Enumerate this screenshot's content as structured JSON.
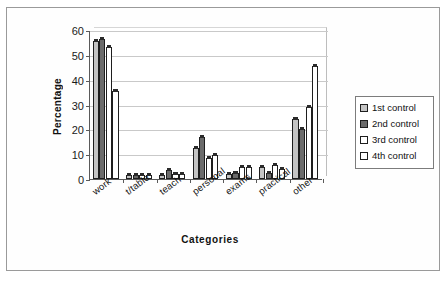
{
  "chart_data": {
    "type": "bar",
    "title": "",
    "xlabel": "Categories",
    "ylabel": "Percentage",
    "ylim": [
      0,
      60
    ],
    "yticks": [
      0,
      10,
      20,
      30,
      40,
      50,
      60
    ],
    "grid": true,
    "legend_position": "right",
    "categories": [
      "work",
      "t/table",
      "teach",
      "personal",
      "exams",
      "practical",
      "other"
    ],
    "series": [
      {
        "name": "1st control",
        "color": "#c4c4c4",
        "values": [
          55.5,
          1.5,
          1.5,
          12.5,
          2.0,
          5.0,
          24.0
        ]
      },
      {
        "name": "2nd control",
        "color": "#6b6b6b",
        "values": [
          56.5,
          1.5,
          3.5,
          17.0,
          2.5,
          2.5,
          20.0
        ]
      },
      {
        "name": "3rd control",
        "color": "#ffffff",
        "values": [
          53.0,
          1.5,
          2.0,
          8.5,
          5.0,
          5.5,
          29.0
        ]
      },
      {
        "name": "4th control",
        "color": "#ffffff",
        "values": [
          35.5,
          1.5,
          2.0,
          9.5,
          5.0,
          4.0,
          45.5
        ]
      }
    ]
  },
  "axis": {
    "y_title": "Percentage",
    "x_title": "Categories"
  }
}
